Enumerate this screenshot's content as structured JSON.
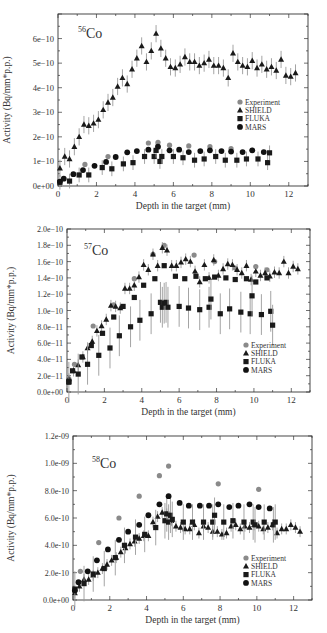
{
  "colors": {
    "experiment": "#8a8a8a",
    "shield": "#1a1a1a",
    "fluka": "#1a1a1a",
    "mars": "#111111",
    "errorbar": "#9a9a9a",
    "axis": "#333333"
  },
  "chart_data": [
    {
      "type": "scatter",
      "title": "56Co",
      "title_mass": "56",
      "title_element": "Co",
      "xlabel": "Depth in the target (mm)",
      "ylabel": "Activity (Bq/mm*p.p.)",
      "xlim": [
        0,
        13
      ],
      "ylim": [
        0,
        7e-10
      ],
      "xticks": [
        0,
        2,
        4,
        6,
        8,
        10,
        12
      ],
      "xtick_labels": [
        "0",
        "2",
        "4",
        "6",
        "8",
        "10",
        "12"
      ],
      "yticks": [
        0,
        1e-10,
        2e-10,
        3e-10,
        4e-10,
        5e-10,
        6e-10
      ],
      "ytick_labels": [
        "0e+00",
        "1e−10",
        "2e−10",
        "3e−10",
        "4e−10",
        "5e−10",
        "6e−10"
      ],
      "grid": false,
      "legend_position": "right-middle",
      "legend": [
        "Experiment",
        "SHIELD",
        "FLUKA",
        "MARS"
      ],
      "series": [
        {
          "name": "Experiment",
          "marker": "circle-gray",
          "x": [
            1.4,
            2.6,
            4.7,
            5.2,
            5.8,
            6.8,
            7.9,
            9.0,
            10.1
          ],
          "y": [
            8.8e-11,
            1.2e-10,
            1.75e-10,
            1.78e-10,
            1.66e-10,
            1.63e-10,
            1.6e-10,
            1.52e-10,
            1.45e-10
          ]
        },
        {
          "name": "SHIELD",
          "marker": "triangle",
          "x": [
            0.1,
            0.35,
            0.6,
            0.85,
            1.1,
            1.35,
            1.6,
            1.85,
            2.1,
            2.35,
            2.6,
            2.85,
            3.1,
            3.35,
            3.6,
            3.85,
            4.1,
            4.35,
            4.6,
            4.85,
            5.1,
            5.35,
            5.6,
            5.85,
            6.1,
            6.35,
            6.6,
            6.85,
            7.1,
            7.35,
            7.6,
            7.85,
            8.1,
            8.35,
            8.6,
            8.85,
            9.1,
            9.35,
            9.6,
            9.85,
            10.1,
            10.35,
            10.6,
            10.85,
            11.1,
            11.35,
            11.6,
            11.85,
            12.1,
            12.35
          ],
          "y": [
            7.2e-11,
            1.2e-10,
            1.1e-10,
            1.6e-10,
            2e-10,
            2.5e-10,
            2.45e-10,
            2.55e-10,
            2.7e-10,
            3.1e-10,
            3.4e-10,
            3.6e-10,
            4.05e-10,
            4.4e-10,
            4.15e-10,
            4.75e-10,
            5.2e-10,
            5.7e-10,
            5.05e-10,
            5.5e-10,
            6.2e-10,
            5.6e-10,
            5.2e-10,
            4.85e-10,
            4.8e-10,
            4.95e-10,
            5.25e-10,
            5.05e-10,
            5.05e-10,
            4.9e-10,
            5e-10,
            5.15e-10,
            4.9e-10,
            4.9e-10,
            4.8e-10,
            4.4e-10,
            5.4e-10,
            5.05e-10,
            4.9e-10,
            4.85e-10,
            5.1e-10,
            4.8e-10,
            4.95e-10,
            4.75e-10,
            4.85e-10,
            4.7e-10,
            5.15e-10,
            4.5e-10,
            4.45e-10,
            4.6e-10
          ],
          "err": 3.5e-11
        },
        {
          "name": "FLUKA",
          "marker": "square",
          "x": [
            0.1,
            0.6,
            1.1,
            1.6,
            2.3,
            2.8,
            3.4,
            3.9,
            4.5,
            5.0,
            5.1,
            5.3,
            5.4,
            6.0,
            6.5,
            7.1,
            7.6,
            8.2,
            8.7,
            9.3,
            9.8,
            10.4,
            10.9,
            11.0
          ],
          "y": [
            1.5e-11,
            2e-11,
            4.5e-11,
            4.5e-11,
            7.5e-11,
            7e-11,
            9e-11,
            9.5e-11,
            1.2e-10,
            1.2e-10,
            1.45e-10,
            1e-10,
            1.2e-10,
            1.2e-10,
            1.15e-10,
            1.05e-10,
            1.1e-10,
            1.2e-10,
            1.05e-10,
            1.05e-10,
            1.1e-10,
            1.1e-10,
            9.5e-11,
            1.35e-10
          ],
          "err": 3e-11
        },
        {
          "name": "MARS",
          "marker": "circle-black",
          "x": [
            0.1,
            0.3,
            0.8,
            1.3,
            1.9,
            2.5,
            3.0,
            3.6,
            4.1,
            4.7,
            5.2,
            5.8,
            6.3,
            6.8,
            7.4,
            7.9,
            8.5,
            9.0,
            9.6,
            10.1,
            10.7
          ],
          "y": [
            1.8e-11,
            3e-11,
            4.8e-11,
            6.5e-11,
            8.2e-11,
            9.8e-11,
            1.18e-10,
            1.37e-10,
            1.42e-10,
            1.48e-10,
            1.6e-10,
            1.45e-10,
            1.48e-10,
            1.38e-10,
            1.42e-10,
            1.45e-10,
            1.42e-10,
            1.4e-10,
            1.38e-10,
            1.45e-10,
            1.38e-10
          ]
        }
      ]
    },
    {
      "type": "scatter",
      "title": "57Co",
      "title_mass": "57",
      "title_element": "Co",
      "xlabel": "Depth in the target (mm)",
      "ylabel": "Activity (Bq/mm*p.p.)",
      "xlim": [
        0,
        13
      ],
      "ylim": [
        0,
        2e-10
      ],
      "xticks": [
        0,
        2,
        4,
        6,
        8,
        10,
        12
      ],
      "xtick_labels": [
        "0",
        "2",
        "4",
        "6",
        "8",
        "10",
        "12"
      ],
      "yticks": [
        0,
        2e-11,
        4e-11,
        6e-11,
        8e-11,
        1e-10,
        1.2e-10,
        1.4e-10,
        1.6e-10,
        1.8e-10,
        2e-10
      ],
      "ytick_labels": [
        "0.0e+00",
        "2.0e−11",
        "4.0e−11",
        "6.0e−11",
        "8.0e−11",
        "1.0e−10",
        "1.2e−10",
        "1.4e−10",
        "1.6e−10",
        "1.8e−10",
        "2.0e−10"
      ],
      "grid": false,
      "legend_position": "lower-right",
      "legend": [
        "Experiment",
        "SHIELD",
        "FLUKA",
        "MARS"
      ],
      "series": [
        {
          "name": "Experiment",
          "marker": "circle-gray",
          "x": [
            0.1,
            0.4,
            1.4,
            2.5,
            3.6,
            4.6,
            5.2,
            6.8,
            7.9,
            9.0,
            10.1,
            10.7
          ],
          "y": [
            1.6e-11,
            3.4e-11,
            8.1e-11,
            1.07e-10,
            1.39e-10,
            1.69e-10,
            1.8e-10,
            1.68e-10,
            1.6e-10,
            1.52e-10,
            1.54e-10,
            1.5e-10
          ]
        },
        {
          "name": "SHIELD",
          "marker": "triangle",
          "x": [
            0.1,
            0.35,
            0.6,
            0.85,
            1.1,
            1.35,
            1.6,
            1.85,
            2.1,
            2.35,
            2.6,
            2.85,
            3.1,
            3.35,
            3.6,
            3.85,
            4.1,
            4.35,
            4.6,
            4.85,
            5.1,
            5.35,
            5.6,
            5.85,
            6.1,
            6.35,
            6.6,
            6.85,
            7.1,
            7.35,
            7.6,
            7.85,
            8.1,
            8.35,
            8.6,
            8.85,
            9.1,
            9.35,
            9.6,
            9.85,
            10.1,
            10.35,
            10.6,
            10.85,
            11.1,
            11.35,
            11.6,
            11.85,
            12.1,
            12.35
          ],
          "y": [
            1.6e-11,
            2.6e-11,
            3.3e-11,
            4.3e-11,
            5.4e-11,
            6.2e-11,
            7.5e-11,
            8.1e-11,
            8.9e-11,
            1.06e-10,
            1.05e-10,
            1.03e-10,
            1.27e-10,
            1.27e-10,
            1.31e-10,
            1.41e-10,
            1.56e-10,
            1.5e-10,
            1.69e-10,
            1.55e-10,
            1.77e-10,
            1.74e-10,
            1.55e-10,
            1.55e-10,
            1.59e-10,
            1.63e-10,
            1.6e-10,
            1.48e-10,
            1.35e-10,
            1.56e-10,
            1.4e-10,
            1.62e-10,
            1.43e-10,
            1.51e-10,
            1.57e-10,
            1.56e-10,
            1.5e-10,
            1.46e-10,
            1.55e-10,
            1.38e-10,
            1.48e-10,
            1.43e-10,
            1.46e-10,
            1.42e-10,
            1.47e-10,
            1.46e-10,
            1.6e-10,
            1.46e-10,
            1.54e-10,
            1.51e-10
          ],
          "err": 7e-12
        },
        {
          "name": "FLUKA",
          "marker": "square",
          "x": [
            0.1,
            0.6,
            1.1,
            1.7,
            2.3,
            2.8,
            3.4,
            3.9,
            4.5,
            5.0,
            5.1,
            5.2,
            5.3,
            5.4,
            6.0,
            6.5,
            7.1,
            7.6,
            7.7,
            8.2,
            8.7,
            9.3,
            9.8,
            9.9,
            10.4,
            10.9,
            11.0
          ],
          "y": [
            1.2e-11,
            2.2e-11,
            3.4e-11,
            4.5e-11,
            5.4e-11,
            6.9e-11,
            8e-11,
            8.8e-11,
            9.6e-11,
            1.1e-10,
            1.04e-10,
            1.09e-10,
            1.1e-10,
            1.04e-10,
            1.05e-10,
            1.03e-10,
            1.01e-10,
            1.04e-10,
            1.14e-10,
            9.6e-11,
            1.02e-10,
            9.8e-11,
            9.6e-11,
            1.18e-10,
            9.5e-11,
            9.9e-11,
            8.2e-11
          ],
          "err": 2.5e-11
        },
        {
          "name": "MARS",
          "marker": "square-black",
          "x": [
            0.1,
            0.3,
            0.8,
            1.3,
            1.9,
            2.5,
            3.0,
            3.6,
            4.1,
            4.7,
            5.2,
            5.8,
            6.3,
            6.9,
            7.4,
            7.9,
            8.5,
            9.0,
            9.6,
            10.1,
            10.7
          ],
          "y": [
            1.3e-11,
            2.6e-11,
            4.3e-11,
            5.7e-11,
            7.2e-11,
            9.2e-11,
            1.05e-10,
            1.16e-10,
            1.31e-10,
            1.39e-10,
            1.55e-10,
            1.42e-10,
            1.39e-10,
            1.42e-10,
            1.39e-10,
            1.41e-10,
            1.4e-10,
            1.38e-10,
            1.39e-10,
            1.35e-10,
            1.4e-10
          ]
        }
      ]
    },
    {
      "type": "scatter",
      "title": "58Co",
      "title_mass": "58",
      "title_element": "Co",
      "xlabel": "Depth in the target (mm)",
      "ylabel": "Activity (Bq/mm*p.p.)",
      "xlim": [
        0,
        13
      ],
      "ylim": [
        0,
        1.2e-09
      ],
      "xticks": [
        0,
        2,
        4,
        6,
        8,
        10,
        12
      ],
      "xtick_labels": [
        "0",
        "2",
        "4",
        "6",
        "8",
        "10",
        "12"
      ],
      "yticks": [
        0,
        2e-10,
        4e-10,
        6e-10,
        8e-10,
        1e-09,
        1.2e-09
      ],
      "ytick_labels": [
        "0.0e+00",
        "2.0e-10",
        "4.0e-10",
        "6.0e-10",
        "8.0e-10",
        "1.0e-09",
        "1.2e-09"
      ],
      "grid": false,
      "legend_position": "lower-right",
      "legend": [
        "Experiment",
        "SHIELD",
        "FLUKA",
        "MARS"
      ],
      "series": [
        {
          "name": "Experiment",
          "marker": "circle-gray",
          "x": [
            0.4,
            1.4,
            2.5,
            3.6,
            4.7,
            5.2,
            7.9,
            10.1
          ],
          "y": [
            2.1e-10,
            4.2e-10,
            6e-10,
            7.6e-10,
            9.1e-10,
            9.8e-10,
            8.5e-10,
            8.1e-10
          ]
        },
        {
          "name": "SHIELD",
          "marker": "triangle",
          "x": [
            0.1,
            0.35,
            0.6,
            0.85,
            1.1,
            1.35,
            1.6,
            1.85,
            2.1,
            2.35,
            2.6,
            2.85,
            3.1,
            3.35,
            3.6,
            3.85,
            4.1,
            4.35,
            4.6,
            4.85,
            5.1,
            5.35,
            5.6,
            5.85,
            6.1,
            6.35,
            6.6,
            6.85,
            7.1,
            7.35,
            7.6,
            7.85,
            8.1,
            8.35,
            8.6,
            8.85,
            9.1,
            9.35,
            9.6,
            9.85,
            10.1,
            10.35,
            10.6,
            10.85,
            11.1,
            11.35,
            11.6,
            11.85,
            12.1,
            12.35
          ],
          "y": [
            5e-11,
            1e-10,
            1.5e-10,
            1.5e-10,
            1.8e-10,
            2e-10,
            2.3e-10,
            2.6e-10,
            2.9e-10,
            3.1e-10,
            3.5e-10,
            3.8e-10,
            4.1e-10,
            4.3e-10,
            4.5e-10,
            4.7e-10,
            4.7e-10,
            5.7e-10,
            6.1e-10,
            6.4e-10,
            6.3e-10,
            5.8e-10,
            5.4e-10,
            5.3e-10,
            5.2e-10,
            5.2e-10,
            5.5e-10,
            4.9e-10,
            5.4e-10,
            5.3e-10,
            5e-10,
            5e-10,
            4.8e-10,
            4.9e-10,
            5.4e-10,
            5.5e-10,
            5.2e-10,
            5.4e-10,
            5.3e-10,
            5.5e-10,
            5.4e-10,
            5.2e-10,
            5.3e-10,
            5.5e-10,
            4.9e-10,
            5.2e-10,
            5.2e-10,
            5.5e-10,
            5.3e-10,
            5e-10
          ],
          "err": 4e-11
        },
        {
          "name": "FLUKA",
          "marker": "square",
          "x": [
            0.1,
            0.6,
            1.1,
            1.7,
            2.3,
            2.8,
            3.4,
            3.9,
            4.5,
            5.0,
            5.1,
            5.2,
            5.3,
            5.4,
            6.0,
            6.5,
            7.1,
            7.6,
            7.7,
            8.2,
            8.7,
            9.3,
            9.8,
            9.9,
            10.4,
            10.9,
            11.0
          ],
          "y": [
            8e-11,
            1.2e-10,
            1.9e-10,
            2.3e-10,
            3.1e-10,
            4e-10,
            4.6e-10,
            4.8e-10,
            5.3e-10,
            5.8e-10,
            6.3e-10,
            5.7e-10,
            6.2e-10,
            5.9e-10,
            5.7e-10,
            5.7e-10,
            5.7e-10,
            5.7e-10,
            6.2e-10,
            5.7e-10,
            5.8e-10,
            5.7e-10,
            5.7e-10,
            5.5e-10,
            5.7e-10,
            5.5e-10,
            5.7e-10
          ],
          "err": 1.3e-10
        },
        {
          "name": "MARS",
          "marker": "circle-black",
          "x": [
            0.1,
            0.3,
            0.8,
            1.3,
            1.9,
            2.5,
            3.0,
            3.6,
            4.1,
            4.7,
            5.2,
            5.8,
            6.3,
            6.9,
            7.4,
            7.9,
            8.5,
            9.0,
            9.6,
            10.1,
            10.7
          ],
          "y": [
            7e-11,
            1.3e-10,
            2.1e-10,
            2.9e-10,
            3.7e-10,
            4.4e-10,
            5e-10,
            5.5e-10,
            6.2e-10,
            7e-10,
            7.6e-10,
            7.1e-10,
            6.9e-10,
            6.9e-10,
            6.9e-10,
            7e-10,
            6.8e-10,
            6.9e-10,
            7e-10,
            6.8e-10,
            6.7e-10
          ]
        }
      ]
    }
  ]
}
